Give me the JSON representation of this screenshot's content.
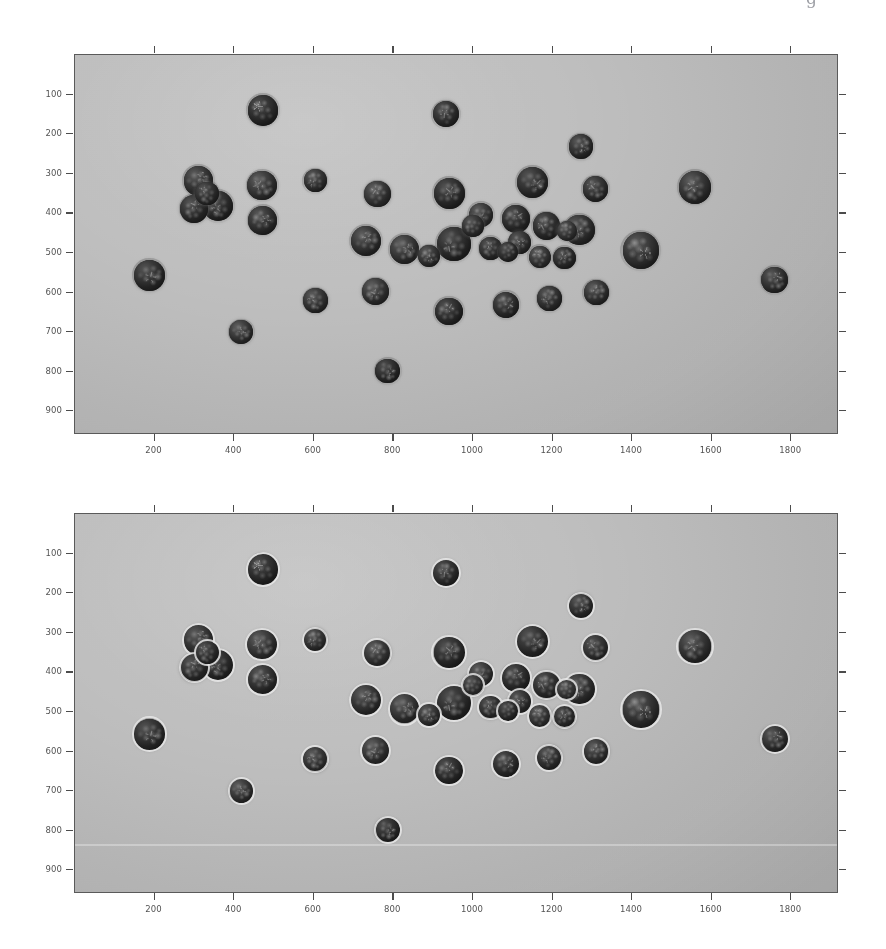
{
  "figure": {
    "caption_remnant": "g",
    "background_color": "#ffffff",
    "plate_color": "#b9b9b9",
    "axis_color": "#5a5a5a",
    "contour_color": "#eeeeee",
    "berry_color": "#1a1a1a"
  },
  "panels": [
    {
      "id": "original-image",
      "name": "Original blueberry image",
      "has_contours": false,
      "xaxis": {
        "ticks": [
          200,
          400,
          600,
          800,
          1000,
          1200,
          1400,
          1600,
          1800
        ],
        "labels": [
          "200",
          "400",
          "600",
          "800",
          "1000",
          "1200",
          "1400",
          "1600",
          "1800"
        ],
        "range": [
          0,
          1920
        ],
        "label": ""
      },
      "yaxis": {
        "ticks": [
          100,
          200,
          300,
          400,
          500,
          600,
          700,
          800,
          900
        ],
        "labels": [
          "100",
          "200",
          "300",
          "400",
          "500",
          "600",
          "700",
          "800",
          "900"
        ],
        "range": [
          0,
          960
        ],
        "label": ""
      }
    },
    {
      "id": "detected-image",
      "name": "Detected blueberries with contours",
      "has_contours": true,
      "xaxis": {
        "ticks": [
          200,
          400,
          600,
          800,
          1000,
          1200,
          1400,
          1600,
          1800
        ],
        "labels": [
          "200",
          "400",
          "600",
          "800",
          "1000",
          "1200",
          "1400",
          "1600",
          "1800"
        ],
        "range": [
          0,
          1920
        ],
        "label": ""
      },
      "yaxis": {
        "ticks": [
          100,
          200,
          300,
          400,
          500,
          600,
          700,
          800,
          900
        ],
        "labels": [
          "100",
          "200",
          "300",
          "400",
          "500",
          "600",
          "700",
          "800",
          "900"
        ],
        "range": [
          0,
          960
        ],
        "label": ""
      }
    }
  ],
  "chart_data": {
    "type": "scatter",
    "title": "",
    "xlabel": "",
    "ylabel": "",
    "xlim": [
      0,
      1920
    ],
    "ylim": [
      960,
      0
    ],
    "grid": false,
    "legend": "none",
    "xticks": [
      200,
      400,
      600,
      800,
      1000,
      1200,
      1400,
      1600,
      1800
    ],
    "yticks": [
      100,
      200,
      300,
      400,
      500,
      600,
      700,
      800,
      900
    ],
    "annotations": [
      "Top panel: original grayscale image of blueberries on a uniform gray background.",
      "Bottom panel: identical image with light circular detection contours overlaid on every berry.",
      "A faint horizontal scanner streak crosses the lower panel near y = 845."
    ],
    "series": [
      {
        "name": "blueberries",
        "count": 41,
        "marker": "filled-circle",
        "color": "#1a1a1a",
        "units": "pixels",
        "points": [
          {
            "id": 1,
            "x": 472,
            "y": 140,
            "d": 76
          },
          {
            "id": 2,
            "x": 932,
            "y": 150,
            "d": 66
          },
          {
            "id": 3,
            "x": 1272,
            "y": 232,
            "d": 62
          },
          {
            "id": 4,
            "x": 310,
            "y": 318,
            "d": 74
          },
          {
            "id": 5,
            "x": 470,
            "y": 330,
            "d": 74
          },
          {
            "id": 6,
            "x": 360,
            "y": 382,
            "d": 76
          },
          {
            "id": 7,
            "x": 300,
            "y": 388,
            "d": 70
          },
          {
            "id": 8,
            "x": 472,
            "y": 418,
            "d": 72
          },
          {
            "id": 9,
            "x": 604,
            "y": 318,
            "d": 58
          },
          {
            "id": 10,
            "x": 760,
            "y": 352,
            "d": 66
          },
          {
            "id": 11,
            "x": 940,
            "y": 350,
            "d": 78
          },
          {
            "id": 12,
            "x": 1150,
            "y": 322,
            "d": 78
          },
          {
            "id": 13,
            "x": 1308,
            "y": 338,
            "d": 64
          },
          {
            "id": 14,
            "x": 1558,
            "y": 334,
            "d": 82
          },
          {
            "id": 15,
            "x": 1020,
            "y": 404,
            "d": 62
          },
          {
            "id": 16,
            "x": 1108,
            "y": 414,
            "d": 70
          },
          {
            "id": 17,
            "x": 1184,
            "y": 432,
            "d": 68
          },
          {
            "id": 18,
            "x": 1268,
            "y": 442,
            "d": 76
          },
          {
            "id": 19,
            "x": 732,
            "y": 470,
            "d": 76
          },
          {
            "id": 20,
            "x": 828,
            "y": 492,
            "d": 74
          },
          {
            "id": 21,
            "x": 952,
            "y": 478,
            "d": 84
          },
          {
            "id": 22,
            "x": 1044,
            "y": 488,
            "d": 58
          },
          {
            "id": 23,
            "x": 1118,
            "y": 474,
            "d": 58
          },
          {
            "id": 24,
            "x": 1422,
            "y": 494,
            "d": 92
          },
          {
            "id": 25,
            "x": 1168,
            "y": 510,
            "d": 56
          },
          {
            "id": 26,
            "x": 1230,
            "y": 512,
            "d": 56
          },
          {
            "id": 27,
            "x": 188,
            "y": 556,
            "d": 78
          },
          {
            "id": 28,
            "x": 1758,
            "y": 568,
            "d": 66
          },
          {
            "id": 29,
            "x": 604,
            "y": 620,
            "d": 62
          },
          {
            "id": 30,
            "x": 756,
            "y": 598,
            "d": 68
          },
          {
            "id": 31,
            "x": 940,
            "y": 648,
            "d": 70
          },
          {
            "id": 32,
            "x": 1084,
            "y": 632,
            "d": 66
          },
          {
            "id": 33,
            "x": 1192,
            "y": 616,
            "d": 62
          },
          {
            "id": 34,
            "x": 1310,
            "y": 600,
            "d": 62
          },
          {
            "id": 35,
            "x": 418,
            "y": 700,
            "d": 60
          },
          {
            "id": 36,
            "x": 786,
            "y": 798,
            "d": 62
          },
          {
            "id": 37,
            "x": 332,
            "y": 350,
            "d": 60
          },
          {
            "id": 38,
            "x": 1000,
            "y": 432,
            "d": 54
          },
          {
            "id": 39,
            "x": 890,
            "y": 508,
            "d": 56
          },
          {
            "id": 40,
            "x": 1236,
            "y": 444,
            "d": 50
          },
          {
            "id": 41,
            "x": 1088,
            "y": 498,
            "d": 52
          }
        ]
      }
    ]
  }
}
